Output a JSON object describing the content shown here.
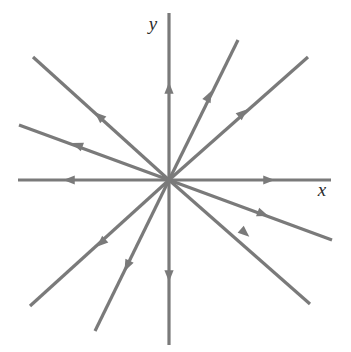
{
  "figure": {
    "kind": "direction-field-phase-portrait",
    "background_color": "#ffffff",
    "stroke_color": "#7a7a7a",
    "label_color": "#2b2b2b",
    "stroke_width": 3.2,
    "canvas": {
      "width": 351,
      "height": 352
    }
  },
  "axes": {
    "origin": {
      "x": 169,
      "y": 180
    },
    "x_axis": {
      "label": "x",
      "label_position": {
        "x": 322,
        "y": 196
      },
      "start": {
        "x": 18,
        "y": 180
      },
      "end": {
        "x": 331,
        "y": 180
      }
    },
    "y_axis": {
      "label": "y",
      "label_position": {
        "x": 153,
        "y": 30
      },
      "start": {
        "x": 169,
        "y": 13
      },
      "end": {
        "x": 169,
        "y": 345
      }
    }
  },
  "chart_data": {
    "type": "scatter",
    "xlabel": "x",
    "ylabel": "y",
    "grid": false,
    "legend": null,
    "equilibrium": {
      "x": 0,
      "y": 0,
      "classification": "unstable node (star / proper node)"
    },
    "flow_direction": "outward (away from origin) on every trajectory",
    "trajectory_count": 12,
    "trajectories": [
      {
        "id": "ray-e",
        "angle_deg": 0,
        "direction": "outward",
        "tip": {
          "x": 331,
          "y": 180
        },
        "arrow_at": {
          "x": 269,
          "y": 180
        },
        "is_axis": true
      },
      {
        "id": "ray-ene",
        "angle_deg": 21,
        "direction": "outward",
        "tip": {
          "x": 332,
          "y": 240
        },
        "arrow_at": {
          "x": 263,
          "y": 214
        },
        "is_axis": false
      },
      {
        "id": "ray-ne",
        "angle_deg": 38,
        "direction": "outward",
        "tip": {
          "x": 310,
          "y": 304
        },
        "arrow_at": {
          "x": 245,
          "y": 233
        },
        "is_axis": false
      },
      {
        "id": "ray-s",
        "angle_deg": 270,
        "direction": "outward",
        "tip": {
          "x": 169,
          "y": 345
        },
        "arrow_at": {
          "x": 169,
          "y": 276
        },
        "is_axis": true
      },
      {
        "id": "ray-ssw",
        "angle_deg": 251,
        "direction": "outward",
        "tip": {
          "x": 95,
          "y": 331
        },
        "arrow_at": {
          "x": 127,
          "y": 266
        },
        "is_axis": false
      },
      {
        "id": "ray-sw",
        "angle_deg": 219,
        "direction": "outward",
        "tip": {
          "x": 30,
          "y": 306
        },
        "arrow_at": {
          "x": 101,
          "y": 243
        },
        "is_axis": false
      },
      {
        "id": "ray-w",
        "angle_deg": 180,
        "direction": "outward",
        "tip": {
          "x": 18,
          "y": 180
        },
        "arrow_at": {
          "x": 69,
          "y": 180
        },
        "is_axis": true
      },
      {
        "id": "ray-wnw",
        "angle_deg": 160,
        "direction": "outward",
        "tip": {
          "x": 19,
          "y": 125
        },
        "arrow_at": {
          "x": 77,
          "y": 145
        },
        "is_axis": false
      },
      {
        "id": "ray-nw",
        "angle_deg": 141,
        "direction": "outward",
        "tip": {
          "x": 33,
          "y": 57
        },
        "arrow_at": {
          "x": 99,
          "y": 116
        },
        "is_axis": false
      },
      {
        "id": "ray-n",
        "angle_deg": 90,
        "direction": "outward",
        "tip": {
          "x": 169,
          "y": 13
        },
        "arrow_at": {
          "x": 169,
          "y": 88
        },
        "is_axis": true
      },
      {
        "id": "ray-nne",
        "angle_deg": 62,
        "direction": "outward",
        "tip": {
          "x": 238,
          "y": 40
        },
        "arrow_at": {
          "x": 209,
          "y": 96
        },
        "is_axis": false
      },
      {
        "id": "ray-nnee",
        "angle_deg": 39,
        "direction": "outward",
        "tip": {
          "x": 308,
          "y": 57
        },
        "arrow_at": {
          "x": 243,
          "y": 113
        },
        "is_axis": false
      }
    ]
  }
}
